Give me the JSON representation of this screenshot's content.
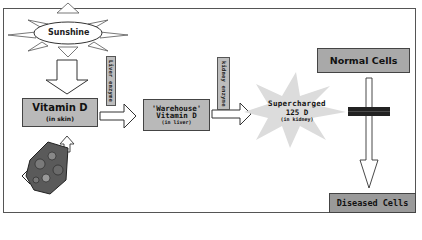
{
  "diagram": {
    "colors": {
      "box_grey": "#b9b9b9",
      "label_grey": "#bdbdbd",
      "burst_grey": "#dcdcdc",
      "border": "#444444",
      "text": "#111111"
    },
    "nodes": {
      "sunshine": {
        "label": "Sunshine"
      },
      "vitamin_d_skin": {
        "label": "Vitamin D",
        "sub": "(in skin)"
      },
      "diet": {
        "label": "Diet",
        "icon": "food-basket-icon"
      },
      "warehouse": {
        "quote_label": "'Warehouse'",
        "label": "Vitamin D",
        "sub": "(in liver)"
      },
      "supercharged": {
        "label": "Supercharged",
        "value": "125 D",
        "sub": "(in kidney)"
      },
      "normal_cells": {
        "label": "Normal Cells"
      },
      "diseased_cells": {
        "label": "Diseased Cells"
      }
    },
    "enzymes": {
      "liver": "Liver enzyme",
      "kidney": "kidney enzyme"
    },
    "edges": [
      {
        "from": "Sunshine",
        "to": "Vitamin D (in skin)"
      },
      {
        "from": "Diet",
        "to": "Vitamin D (in skin)"
      },
      {
        "from": "Vitamin D (in skin)",
        "to": "'Warehouse' Vitamin D (in liver)",
        "via": "Liver enzyme"
      },
      {
        "from": "'Warehouse' Vitamin D (in liver)",
        "to": "Supercharged 125 D (in kidney)",
        "via": "kidney enzyme"
      },
      {
        "from": "Normal Cells",
        "to": "Diseased Cells",
        "blocked": true
      }
    ]
  }
}
